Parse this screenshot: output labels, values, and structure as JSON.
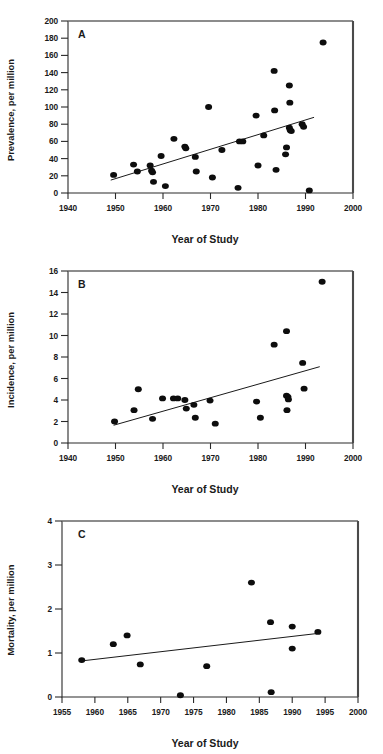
{
  "figure": {
    "name": "three-panel-scatter-figure",
    "panels": [
      "A",
      "B",
      "C"
    ]
  },
  "chart_data": [
    {
      "type": "scatter",
      "panel_label": "A",
      "title": "",
      "xlabel": "Year of Study",
      "ylabel": "Prevalence, per million",
      "xlim": [
        1940,
        2000
      ],
      "ylim": [
        0,
        200
      ],
      "xticks": [
        1940,
        1950,
        1960,
        1970,
        1980,
        1990,
        2000
      ],
      "xticklabels": [
        "1940",
        "1950",
        "1960",
        "1970",
        "1980",
        "1990",
        "2000"
      ],
      "yticks": [
        0,
        20,
        40,
        60,
        80,
        100,
        120,
        140,
        160,
        180,
        200
      ],
      "yticklabels": [
        "0",
        "20",
        "40",
        "60",
        "80",
        "100",
        "120",
        "140",
        "160",
        "180",
        "200"
      ],
      "grid": false,
      "legend": "none",
      "marker": "filled-circle",
      "points": [
        {
          "x": 1949.6,
          "y": 21
        },
        {
          "x": 1953.8,
          "y": 33
        },
        {
          "x": 1954.6,
          "y": 25
        },
        {
          "x": 1957.3,
          "y": 32
        },
        {
          "x": 1957.6,
          "y": 26
        },
        {
          "x": 1957.8,
          "y": 24
        },
        {
          "x": 1958.0,
          "y": 13
        },
        {
          "x": 1959.6,
          "y": 43
        },
        {
          "x": 1960.5,
          "y": 8
        },
        {
          "x": 1962.3,
          "y": 63
        },
        {
          "x": 1964.6,
          "y": 54
        },
        {
          "x": 1964.8,
          "y": 52
        },
        {
          "x": 1966.8,
          "y": 42
        },
        {
          "x": 1967.0,
          "y": 25
        },
        {
          "x": 1969.6,
          "y": 100
        },
        {
          "x": 1970.4,
          "y": 18
        },
        {
          "x": 1972.4,
          "y": 50
        },
        {
          "x": 1975.8,
          "y": 6
        },
        {
          "x": 1976.1,
          "y": 60
        },
        {
          "x": 1976.8,
          "y": 60
        },
        {
          "x": 1979.6,
          "y": 90
        },
        {
          "x": 1980.0,
          "y": 32
        },
        {
          "x": 1981.2,
          "y": 67
        },
        {
          "x": 1983.4,
          "y": 142
        },
        {
          "x": 1983.5,
          "y": 96
        },
        {
          "x": 1983.8,
          "y": 27
        },
        {
          "x": 1985.8,
          "y": 45
        },
        {
          "x": 1986.0,
          "y": 53
        },
        {
          "x": 1986.6,
          "y": 125
        },
        {
          "x": 1986.7,
          "y": 105
        },
        {
          "x": 1986.6,
          "y": 76
        },
        {
          "x": 1986.8,
          "y": 73
        },
        {
          "x": 1987.0,
          "y": 72
        },
        {
          "x": 1989.3,
          "y": 80
        },
        {
          "x": 1989.6,
          "y": 77
        },
        {
          "x": 1990.8,
          "y": 3
        },
        {
          "x": 1993.7,
          "y": 175
        }
      ],
      "trendline": {
        "x0": 1949.0,
        "y0": 15,
        "x1": 1991.8,
        "y1": 88
      }
    },
    {
      "type": "scatter",
      "panel_label": "B",
      "title": "",
      "xlabel": "Year of Study",
      "ylabel": "Incidence, per million",
      "xlim": [
        1940,
        2000
      ],
      "ylim": [
        0,
        16
      ],
      "xticks": [
        1940,
        1950,
        1960,
        1970,
        1980,
        1990,
        2000
      ],
      "xticklabels": [
        "1940",
        "1950",
        "1960",
        "1970",
        "1980",
        "1990",
        "2000"
      ],
      "yticks": [
        0,
        2,
        4,
        6,
        8,
        10,
        12,
        14,
        16
      ],
      "yticklabels": [
        "0",
        "2",
        "4",
        "6",
        "8",
        "10",
        "12",
        "14",
        "16"
      ],
      "grid": false,
      "legend": "none",
      "marker": "filled-circle",
      "points": [
        {
          "x": 1949.8,
          "y": 2.0
        },
        {
          "x": 1953.9,
          "y": 3.05
        },
        {
          "x": 1954.8,
          "y": 5.0
        },
        {
          "x": 1957.8,
          "y": 2.25
        },
        {
          "x": 1959.9,
          "y": 4.15
        },
        {
          "x": 1962.2,
          "y": 4.15
        },
        {
          "x": 1963.1,
          "y": 4.15
        },
        {
          "x": 1964.6,
          "y": 4.0
        },
        {
          "x": 1964.9,
          "y": 3.2
        },
        {
          "x": 1966.5,
          "y": 3.55
        },
        {
          "x": 1966.8,
          "y": 2.35
        },
        {
          "x": 1969.9,
          "y": 3.95
        },
        {
          "x": 1971.0,
          "y": 1.8
        },
        {
          "x": 1979.7,
          "y": 3.85
        },
        {
          "x": 1980.5,
          "y": 2.35
        },
        {
          "x": 1983.4,
          "y": 9.15
        },
        {
          "x": 1986.0,
          "y": 10.4
        },
        {
          "x": 1986.0,
          "y": 4.4
        },
        {
          "x": 1986.3,
          "y": 4.3
        },
        {
          "x": 1986.4,
          "y": 4.05
        },
        {
          "x": 1986.1,
          "y": 3.05
        },
        {
          "x": 1989.4,
          "y": 7.45
        },
        {
          "x": 1989.7,
          "y": 5.05
        },
        {
          "x": 1993.5,
          "y": 15.0
        }
      ],
      "trendline": {
        "x0": 1949.6,
        "y0": 1.65,
        "x1": 1993.0,
        "y1": 7.1
      }
    },
    {
      "type": "scatter",
      "panel_label": "C",
      "title": "",
      "xlabel": "Year of Study",
      "ylabel": "Mortality, per million",
      "xlim": [
        1955,
        2000
      ],
      "ylim": [
        0,
        4
      ],
      "xticks": [
        1955,
        1960,
        1965,
        1970,
        1975,
        1980,
        1985,
        1990,
        1995,
        2000
      ],
      "xticklabels": [
        "1955",
        "1960",
        "1965",
        "1970",
        "1975",
        "1980",
        "1985",
        "1990",
        "1995",
        "2000"
      ],
      "yticks": [
        0,
        1,
        2,
        3,
        4
      ],
      "yticklabels": [
        "0",
        "1",
        "2",
        "3",
        "4"
      ],
      "grid": false,
      "legend": "none",
      "marker": "filled-circle",
      "points": [
        {
          "x": 1958.0,
          "y": 0.84
        },
        {
          "x": 1962.8,
          "y": 1.2
        },
        {
          "x": 1964.9,
          "y": 1.4
        },
        {
          "x": 1966.9,
          "y": 0.74
        },
        {
          "x": 1973.0,
          "y": 0.04
        },
        {
          "x": 1977.0,
          "y": 0.7
        },
        {
          "x": 1983.8,
          "y": 2.6
        },
        {
          "x": 1986.7,
          "y": 1.7
        },
        {
          "x": 1986.8,
          "y": 0.11
        },
        {
          "x": 1990.0,
          "y": 1.6
        },
        {
          "x": 1990.0,
          "y": 1.1
        },
        {
          "x": 1993.9,
          "y": 1.48
        }
      ],
      "trendline": {
        "x0": 1958.0,
        "y0": 0.82,
        "x1": 1994.2,
        "y1": 1.45
      }
    }
  ]
}
